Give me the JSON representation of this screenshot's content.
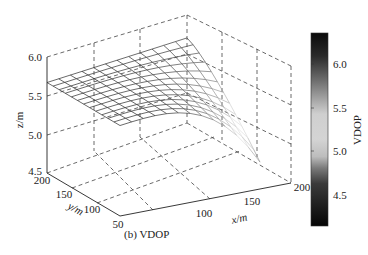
{
  "chart_data": {
    "type": "surface",
    "title": "",
    "caption": "(b) VDOP",
    "xlabel": "x/m",
    "ylabel": "y/m",
    "zlabel": "z/m",
    "x_ticks": [
      "100",
      "150",
      "200"
    ],
    "y_ticks": [
      "50",
      "100",
      "150",
      "200"
    ],
    "z_ticks": [
      "4.5",
      "5.0",
      "5.5",
      "6.0"
    ],
    "xlim": [
      50,
      200
    ],
    "ylim": [
      50,
      200
    ],
    "zlim": [
      4.5,
      6.0
    ],
    "colorbar": {
      "label": "VDOP",
      "ticks": [
        "4.5",
        "5.0",
        "5.5",
        "6.0"
      ],
      "range": [
        4.2,
        6.35
      ],
      "colormap": "gray-diverging (dark at both ends, light near 5.3)"
    },
    "grid": true,
    "surface_summary": {
      "x": [
        50,
        62.5,
        75,
        87.5,
        100,
        112.5,
        125,
        137.5,
        150,
        162.5,
        175,
        187.5,
        200
      ],
      "y": [
        50,
        62.5,
        75,
        87.5,
        100,
        112.5,
        125,
        137.5,
        150,
        162.5,
        175,
        187.5,
        200
      ],
      "note": "Surface roughly flat at z≈5.65 over most of domain, sloping down to z≈4.55 near x=200, y=50",
      "corner_values": {
        "x50_y200": 5.67,
        "x50_y50": 5.66,
        "x200_y200": 5.6,
        "x200_y50": 4.55
      }
    }
  },
  "labels": {
    "caption": "(b) VDOP",
    "xlabel": "x/m",
    "ylabel": "y/m",
    "zlabel": "z/m",
    "colorbar_label": "VDOP",
    "z_ticks": [
      "6.0",
      "5.5",
      "5.0",
      "4.5"
    ],
    "y_ticks": [
      "200",
      "150",
      "100",
      "50"
    ],
    "x_ticks": [
      "100",
      "150",
      "200"
    ],
    "cb_ticks": [
      "6.0",
      "5.5",
      "5.0",
      "4.5"
    ]
  }
}
